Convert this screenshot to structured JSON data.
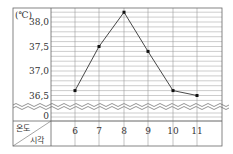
{
  "chart_data": {
    "type": "line",
    "title": "",
    "unit_label": "(℃)",
    "xlabel": "시각",
    "ylabel": "온도",
    "x": [
      "6",
      "7",
      "8",
      "9",
      "10",
      "11"
    ],
    "values": [
      36.6,
      37.5,
      38.2,
      37.4,
      36.6,
      36.5
    ],
    "y_ticks": [
      "38,0",
      "37,5",
      "37,0",
      "36,5",
      "0"
    ],
    "ylim": [
      36.3,
      38.3
    ],
    "axis_break": true,
    "grid": true,
    "grid_step": 0.1
  },
  "colors": {
    "grid": "#9a9a9a",
    "frame": "#666666",
    "line": "#333333",
    "marker": "#111111"
  }
}
